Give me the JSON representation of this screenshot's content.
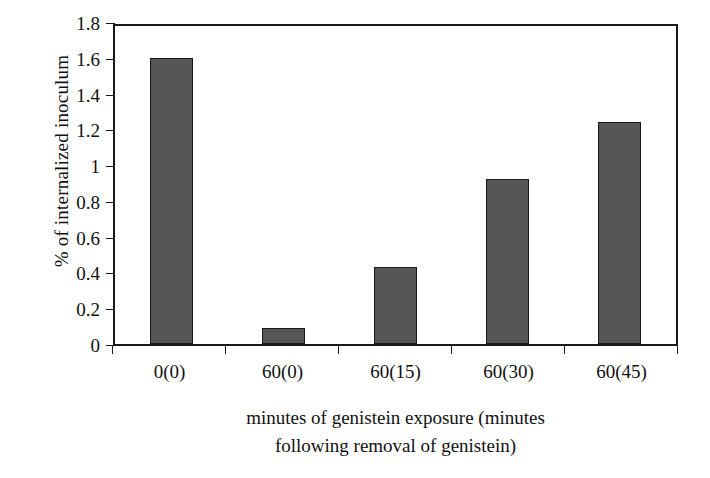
{
  "chart_data": {
    "type": "bar",
    "title": "",
    "subtitle": "",
    "categories": [
      "0(0)",
      "60(0)",
      "60(15)",
      "60(30)",
      "60(45)"
    ],
    "values": [
      1.6,
      0.09,
      0.43,
      0.92,
      1.24
    ],
    "series": [
      {
        "name": "% of internalized inoculum",
        "values": [
          1.6,
          0.09,
          0.43,
          0.92,
          1.24
        ]
      }
    ],
    "xlabel": "minutes of genistein exposure (minutes following removal of genistein)",
    "xlabel_lines": [
      "minutes of genistein exposure (minutes",
      "following removal of genistein)"
    ],
    "ylabel": "% of internalized inoculum",
    "ylim": [
      0,
      1.8
    ],
    "yticks": [
      0,
      0.2,
      0.4,
      0.6,
      0.8,
      1,
      1.2,
      1.4,
      1.6,
      1.8
    ],
    "ytick_labels": [
      "0",
      "0.2",
      "0.4",
      "0.6",
      "0.8",
      "1",
      "1.2",
      "1.4",
      "1.6",
      "1.8"
    ],
    "grid": false,
    "legend": false,
    "legend_position": "none",
    "bar_color": "#565656",
    "bar_edge_color": "#1a1a1a",
    "axis_color": "#1a1a1a",
    "background_color": "#ffffff"
  }
}
